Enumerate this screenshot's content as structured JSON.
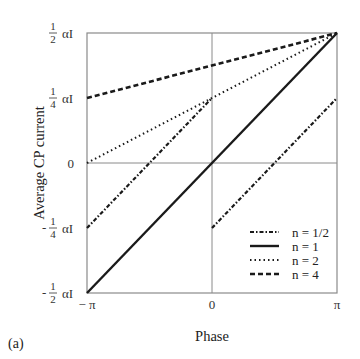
{
  "chart_data": {
    "type": "line",
    "panel_label": "(a)",
    "xlabel": "Phase",
    "ylabel": "Average CP current",
    "xlim": [
      -3.14159,
      3.14159
    ],
    "ylim": [
      -0.5,
      0.5
    ],
    "y_units": "αI",
    "x_ticks": [
      {
        "value": -3.14159,
        "label": "− π"
      },
      {
        "value": 0,
        "label": "0"
      },
      {
        "value": 3.14159,
        "label": "π"
      }
    ],
    "y_ticks": [
      {
        "value": 0.5,
        "sign": "",
        "num": "1",
        "den": "2",
        "unit": "αI"
      },
      {
        "value": 0.25,
        "sign": "",
        "num": "1",
        "den": "4",
        "unit": "αI"
      },
      {
        "value": 0,
        "label": "0"
      },
      {
        "value": -0.25,
        "sign": "-",
        "num": "1",
        "den": "4",
        "unit": "αI"
      },
      {
        "value": -0.5,
        "sign": "-",
        "num": "1",
        "den": "2",
        "unit": "αI"
      }
    ],
    "grid": {
      "x_zero_line": true,
      "y_zero_line": true
    },
    "legend_position": "lower right",
    "series": [
      {
        "name": "n = 1/2",
        "style": "dash-dot",
        "segments": [
          {
            "x": [
              -3.14159,
              0
            ],
            "y": [
              -0.25,
              0.25
            ]
          },
          {
            "x": [
              0,
              3.14159
            ],
            "y": [
              -0.25,
              0.25
            ]
          }
        ]
      },
      {
        "name": "n = 1",
        "style": "solid",
        "segments": [
          {
            "x": [
              -3.14159,
              3.14159
            ],
            "y": [
              -0.5,
              0.5
            ]
          }
        ]
      },
      {
        "name": "n = 2",
        "style": "dotted",
        "segments": [
          {
            "x": [
              -3.14159,
              3.14159
            ],
            "y": [
              0,
              0.5
            ]
          }
        ]
      },
      {
        "name": "n = 4",
        "style": "dashed",
        "segments": [
          {
            "x": [
              -3.14159,
              3.14159
            ],
            "y": [
              0.25,
              0.5
            ]
          }
        ]
      }
    ]
  }
}
